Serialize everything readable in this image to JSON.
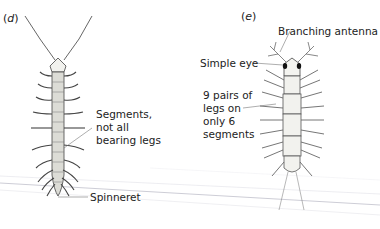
{
  "panels": [
    {
      "id": "d",
      "letter": "d",
      "labels": {
        "segments": "Segments,\nnot all\nbearing legs",
        "spinneret": "Spinneret"
      }
    },
    {
      "id": "e",
      "letter": "e",
      "labels": {
        "antenna": "Branching antenna",
        "eye": "Simple eye",
        "legs": "9 pairs of\nlegs on\nonly 6\nsegments"
      }
    }
  ],
  "colors": {
    "ink": "#333333",
    "body_fill": "#e8e8e4",
    "stray_lines": "#c8c8d0"
  }
}
